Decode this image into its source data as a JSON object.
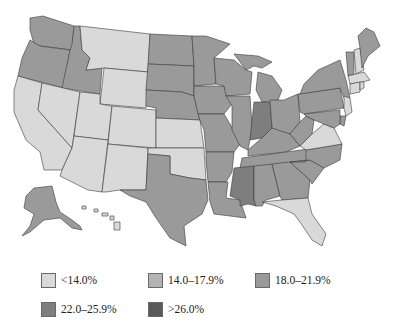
{
  "map": {
    "title": "",
    "region": "United States",
    "states": {
      "WA": "c3",
      "OR": "c3",
      "ID": "c3",
      "MT": "c1",
      "WY": "c1",
      "CA": "c1",
      "NV": "c1",
      "UT": "c1",
      "CO": "c1",
      "AZ": "c1",
      "NM": "c1",
      "ND": "c3",
      "SD": "c3",
      "NE": "c3",
      "KS": "c1",
      "OK": "c1",
      "TX": "c3",
      "MN": "c3",
      "IA": "c3",
      "MO": "c3",
      "AR": "c3",
      "LA": "c3",
      "WI": "c3",
      "IL": "c3",
      "MI": "c3",
      "IN": "c4",
      "OH": "c3",
      "KY": "c3",
      "TN": "c3",
      "MS": "c4",
      "AL": "c3",
      "GA": "c3",
      "FL": "c1",
      "SC": "c3",
      "NC": "c3",
      "VA": "c1",
      "WV": "c3",
      "PA": "c3",
      "NY": "c3",
      "NJ": "c1",
      "DE": "c3",
      "MD": "c3",
      "VT": "c3",
      "NH": "c1",
      "ME": "c3",
      "MA": "c1",
      "CT": "c1",
      "RI": "c1",
      "AK": "c3",
      "HI": "c1"
    }
  },
  "legend": {
    "items": [
      {
        "key": "c1",
        "label": "<14.0%",
        "color": "#d9d9d9"
      },
      {
        "key": "c2",
        "label": "14.0–17.9%",
        "color": "#b3b3b3"
      },
      {
        "key": "c3",
        "label": "18.0–21.9%",
        "color": "#9a9a9a"
      },
      {
        "key": "c4",
        "label": "22.0–25.9%",
        "color": "#7e7e7e"
      },
      {
        "key": "c5",
        "label": ">26.0%",
        "color": "#5a5a5a"
      }
    ]
  }
}
